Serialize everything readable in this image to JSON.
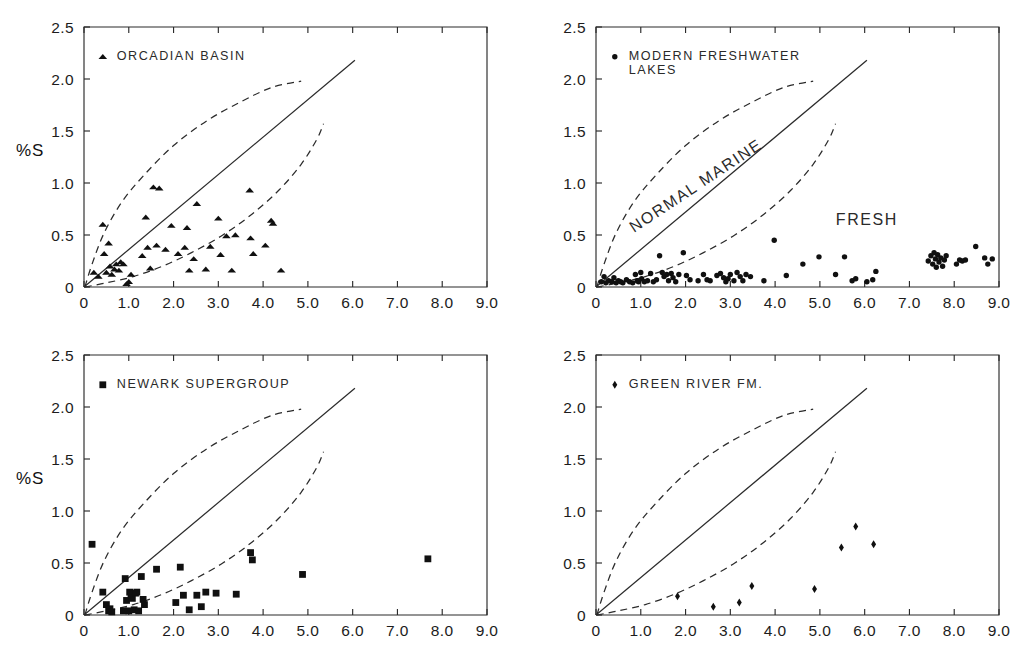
{
  "figure": {
    "panel_count": 4,
    "background": "#ffffff",
    "ink_color": "#1a1a1a"
  },
  "axes": {
    "xlabel": "% Org C",
    "ylabel": "%S",
    "xlim": [
      0,
      9.0
    ],
    "ylim": [
      0,
      2.5
    ],
    "xticks": [
      0,
      1.0,
      2.0,
      3.0,
      4.0,
      5.0,
      6.0,
      7.0,
      8.0,
      9.0
    ],
    "xtick_labels": [
      "0",
      "1.0",
      "2.0",
      "3.0",
      "4.0",
      "5.0",
      "6.0",
      "7.0",
      "8.0",
      "9.0"
    ],
    "yticks": [
      0,
      0.5,
      1.0,
      1.5,
      2.0,
      2.5
    ],
    "ytick_labels": [
      "0",
      "0.5",
      "1.0",
      "1.5",
      "2.0",
      "2.5"
    ],
    "grid": false
  },
  "reference_curves": {
    "normal_marine_line": {
      "label": "NORMAL MARINE",
      "style": "solid",
      "points": [
        [
          0,
          0
        ],
        [
          6.05,
          2.18
        ]
      ]
    },
    "upper_envelope": {
      "style": "dashed",
      "points": [
        [
          0.02,
          0.0
        ],
        [
          0.18,
          0.22
        ],
        [
          0.45,
          0.52
        ],
        [
          0.85,
          0.82
        ],
        [
          1.35,
          1.08
        ],
        [
          2.0,
          1.36
        ],
        [
          2.75,
          1.6
        ],
        [
          3.5,
          1.78
        ],
        [
          4.2,
          1.92
        ],
        [
          4.85,
          1.98
        ]
      ]
    },
    "lower_envelope": {
      "style": "dashed",
      "points": [
        [
          0.02,
          0.0
        ],
        [
          0.5,
          0.04
        ],
        [
          1.1,
          0.1
        ],
        [
          1.75,
          0.2
        ],
        [
          2.4,
          0.33
        ],
        [
          3.1,
          0.5
        ],
        [
          3.75,
          0.7
        ],
        [
          4.35,
          0.93
        ],
        [
          4.85,
          1.18
        ],
        [
          5.2,
          1.42
        ],
        [
          5.35,
          1.57
        ]
      ]
    },
    "fresh_label": "FRESH"
  },
  "chart_data": [
    {
      "type": "scatter",
      "id": "orcadian-basin",
      "position": "top-left",
      "title": "",
      "legend": "ORCADIAN BASIN",
      "marker": "triangle",
      "xlabel": "% Org C",
      "ylabel": "%S",
      "xlim": [
        0,
        9.0
      ],
      "ylim": [
        0,
        2.5
      ],
      "show_xlabel": false,
      "show_ylabel": true,
      "show_fresh_label": false,
      "show_marine_label": false,
      "points": [
        [
          0.22,
          0.14
        ],
        [
          0.32,
          0.1
        ],
        [
          0.42,
          0.6
        ],
        [
          0.45,
          0.32
        ],
        [
          0.5,
          0.14
        ],
        [
          0.55,
          0.42
        ],
        [
          0.58,
          0.2
        ],
        [
          0.62,
          0.12
        ],
        [
          0.68,
          0.17
        ],
        [
          0.72,
          0.22
        ],
        [
          0.78,
          0.16
        ],
        [
          0.82,
          0.24
        ],
        [
          0.88,
          0.22
        ],
        [
          0.95,
          0.03
        ],
        [
          1.0,
          0.05
        ],
        [
          1.05,
          0.12
        ],
        [
          1.3,
          0.3
        ],
        [
          1.38,
          0.67
        ],
        [
          1.42,
          0.38
        ],
        [
          1.48,
          0.18
        ],
        [
          1.55,
          0.96
        ],
        [
          1.62,
          0.4
        ],
        [
          1.68,
          0.95
        ],
        [
          1.82,
          0.36
        ],
        [
          1.95,
          0.59
        ],
        [
          2.1,
          0.32
        ],
        [
          2.25,
          0.38
        ],
        [
          2.3,
          0.57
        ],
        [
          2.35,
          0.16
        ],
        [
          2.45,
          0.27
        ],
        [
          2.52,
          0.8
        ],
        [
          2.72,
          0.17
        ],
        [
          2.82,
          0.39
        ],
        [
          3.0,
          0.66
        ],
        [
          3.05,
          0.31
        ],
        [
          3.18,
          0.49
        ],
        [
          3.3,
          0.16
        ],
        [
          3.38,
          0.5
        ],
        [
          3.7,
          0.93
        ],
        [
          3.72,
          0.47
        ],
        [
          3.78,
          0.32
        ],
        [
          4.05,
          0.4
        ],
        [
          4.18,
          0.64
        ],
        [
          4.22,
          0.61
        ],
        [
          4.4,
          0.16
        ]
      ]
    },
    {
      "type": "scatter",
      "id": "modern-freshwater-lakes",
      "position": "top-right",
      "title": "",
      "legend": "MODERN FRESHWATER\nLAKES",
      "legend_line1": "MODERN FRESHWATER",
      "legend_line2": "LAKES",
      "marker": "circle",
      "xlabel": "% Org C",
      "ylabel": "%S",
      "xlim": [
        0,
        9.0
      ],
      "ylim": [
        0,
        2.5
      ],
      "show_xlabel": false,
      "show_ylabel": false,
      "show_fresh_label": true,
      "show_marine_label": true,
      "points": [
        [
          0.12,
          0.05
        ],
        [
          0.18,
          0.1
        ],
        [
          0.22,
          0.04
        ],
        [
          0.28,
          0.06
        ],
        [
          0.35,
          0.05
        ],
        [
          0.4,
          0.09
        ],
        [
          0.45,
          0.04
        ],
        [
          0.5,
          0.06
        ],
        [
          0.55,
          0.05
        ],
        [
          0.6,
          0.04
        ],
        [
          0.68,
          0.07
        ],
        [
          0.75,
          0.05
        ],
        [
          0.82,
          0.04
        ],
        [
          0.88,
          0.12
        ],
        [
          0.92,
          0.06
        ],
        [
          0.95,
          0.05
        ],
        [
          1.0,
          0.14
        ],
        [
          1.02,
          0.08
        ],
        [
          1.08,
          0.05
        ],
        [
          1.15,
          0.06
        ],
        [
          1.22,
          0.13
        ],
        [
          1.28,
          0.05
        ],
        [
          1.35,
          0.07
        ],
        [
          1.42,
          0.3
        ],
        [
          1.48,
          0.14
        ],
        [
          1.52,
          0.1
        ],
        [
          1.58,
          0.12
        ],
        [
          1.62,
          0.06
        ],
        [
          1.68,
          0.13
        ],
        [
          1.72,
          0.09
        ],
        [
          1.78,
          0.05
        ],
        [
          1.85,
          0.12
        ],
        [
          1.95,
          0.33
        ],
        [
          2.02,
          0.11
        ],
        [
          2.1,
          0.07
        ],
        [
          2.28,
          0.06
        ],
        [
          2.4,
          0.12
        ],
        [
          2.48,
          0.07
        ],
        [
          2.55,
          0.06
        ],
        [
          2.7,
          0.11
        ],
        [
          2.78,
          0.13
        ],
        [
          2.85,
          0.09
        ],
        [
          2.9,
          0.05
        ],
        [
          2.95,
          0.08
        ],
        [
          3.0,
          0.12
        ],
        [
          3.08,
          0.06
        ],
        [
          3.15,
          0.14
        ],
        [
          3.22,
          0.1
        ],
        [
          3.28,
          0.06
        ],
        [
          3.35,
          0.12
        ],
        [
          3.45,
          0.1
        ],
        [
          3.75,
          0.06
        ],
        [
          3.98,
          0.45
        ],
        [
          4.25,
          0.11
        ],
        [
          4.62,
          0.22
        ],
        [
          4.98,
          0.29
        ],
        [
          5.35,
          0.12
        ],
        [
          5.55,
          0.29
        ],
        [
          5.72,
          0.06
        ],
        [
          5.8,
          0.08
        ],
        [
          6.05,
          0.05
        ],
        [
          6.18,
          0.07
        ],
        [
          6.25,
          0.15
        ],
        [
          7.42,
          0.25
        ],
        [
          7.48,
          0.3
        ],
        [
          7.52,
          0.22
        ],
        [
          7.55,
          0.33
        ],
        [
          7.58,
          0.27
        ],
        [
          7.6,
          0.19
        ],
        [
          7.63,
          0.31
        ],
        [
          7.66,
          0.24
        ],
        [
          7.7,
          0.28
        ],
        [
          7.74,
          0.2
        ],
        [
          7.78,
          0.26
        ],
        [
          7.82,
          0.3
        ],
        [
          8.05,
          0.22
        ],
        [
          8.12,
          0.26
        ],
        [
          8.18,
          0.25
        ],
        [
          8.25,
          0.26
        ],
        [
          8.48,
          0.39
        ],
        [
          8.68,
          0.28
        ],
        [
          8.75,
          0.22
        ],
        [
          8.85,
          0.27
        ]
      ]
    },
    {
      "type": "scatter",
      "id": "newark-supergroup",
      "position": "bottom-left",
      "title": "",
      "legend": "NEWARK SUPERGROUP",
      "marker": "square",
      "xlabel": "% Org C",
      "ylabel": "%S",
      "xlim": [
        0,
        9.0
      ],
      "ylim": [
        0,
        2.5
      ],
      "show_xlabel": true,
      "show_ylabel": true,
      "show_fresh_label": false,
      "show_marine_label": false,
      "points": [
        [
          0.18,
          0.68
        ],
        [
          0.42,
          0.22
        ],
        [
          0.5,
          0.1
        ],
        [
          0.55,
          0.04
        ],
        [
          0.58,
          0.06
        ],
        [
          0.62,
          0.03
        ],
        [
          0.88,
          0.04
        ],
        [
          0.92,
          0.35
        ],
        [
          0.95,
          0.14
        ],
        [
          1.0,
          0.04
        ],
        [
          1.02,
          0.22
        ],
        [
          1.05,
          0.2
        ],
        [
          1.08,
          0.16
        ],
        [
          1.12,
          0.05
        ],
        [
          1.15,
          0.21
        ],
        [
          1.18,
          0.22
        ],
        [
          1.22,
          0.04
        ],
        [
          1.28,
          0.37
        ],
        [
          1.32,
          0.15
        ],
        [
          1.35,
          0.1
        ],
        [
          1.62,
          0.44
        ],
        [
          2.05,
          0.12
        ],
        [
          2.15,
          0.46
        ],
        [
          2.22,
          0.19
        ],
        [
          2.35,
          0.05
        ],
        [
          2.52,
          0.19
        ],
        [
          2.62,
          0.08
        ],
        [
          2.72,
          0.22
        ],
        [
          2.95,
          0.21
        ],
        [
          3.4,
          0.2
        ],
        [
          3.72,
          0.6
        ],
        [
          3.76,
          0.53
        ],
        [
          4.88,
          0.39
        ],
        [
          7.68,
          0.54
        ]
      ]
    },
    {
      "type": "scatter",
      "id": "green-river-fm",
      "position": "bottom-right",
      "title": "",
      "legend": "GREEN RIVER FM.",
      "marker": "diamond",
      "xlabel": "% Org C",
      "ylabel": "%S",
      "xlim": [
        0,
        9.0
      ],
      "ylim": [
        0,
        2.5
      ],
      "show_xlabel": true,
      "show_ylabel": false,
      "show_fresh_label": false,
      "show_marine_label": false,
      "points": [
        [
          1.82,
          0.18
        ],
        [
          2.62,
          0.08
        ],
        [
          3.2,
          0.12
        ],
        [
          3.48,
          0.28
        ],
        [
          4.88,
          0.25
        ],
        [
          5.48,
          0.65
        ],
        [
          5.8,
          0.85
        ],
        [
          6.2,
          0.68
        ]
      ]
    }
  ]
}
